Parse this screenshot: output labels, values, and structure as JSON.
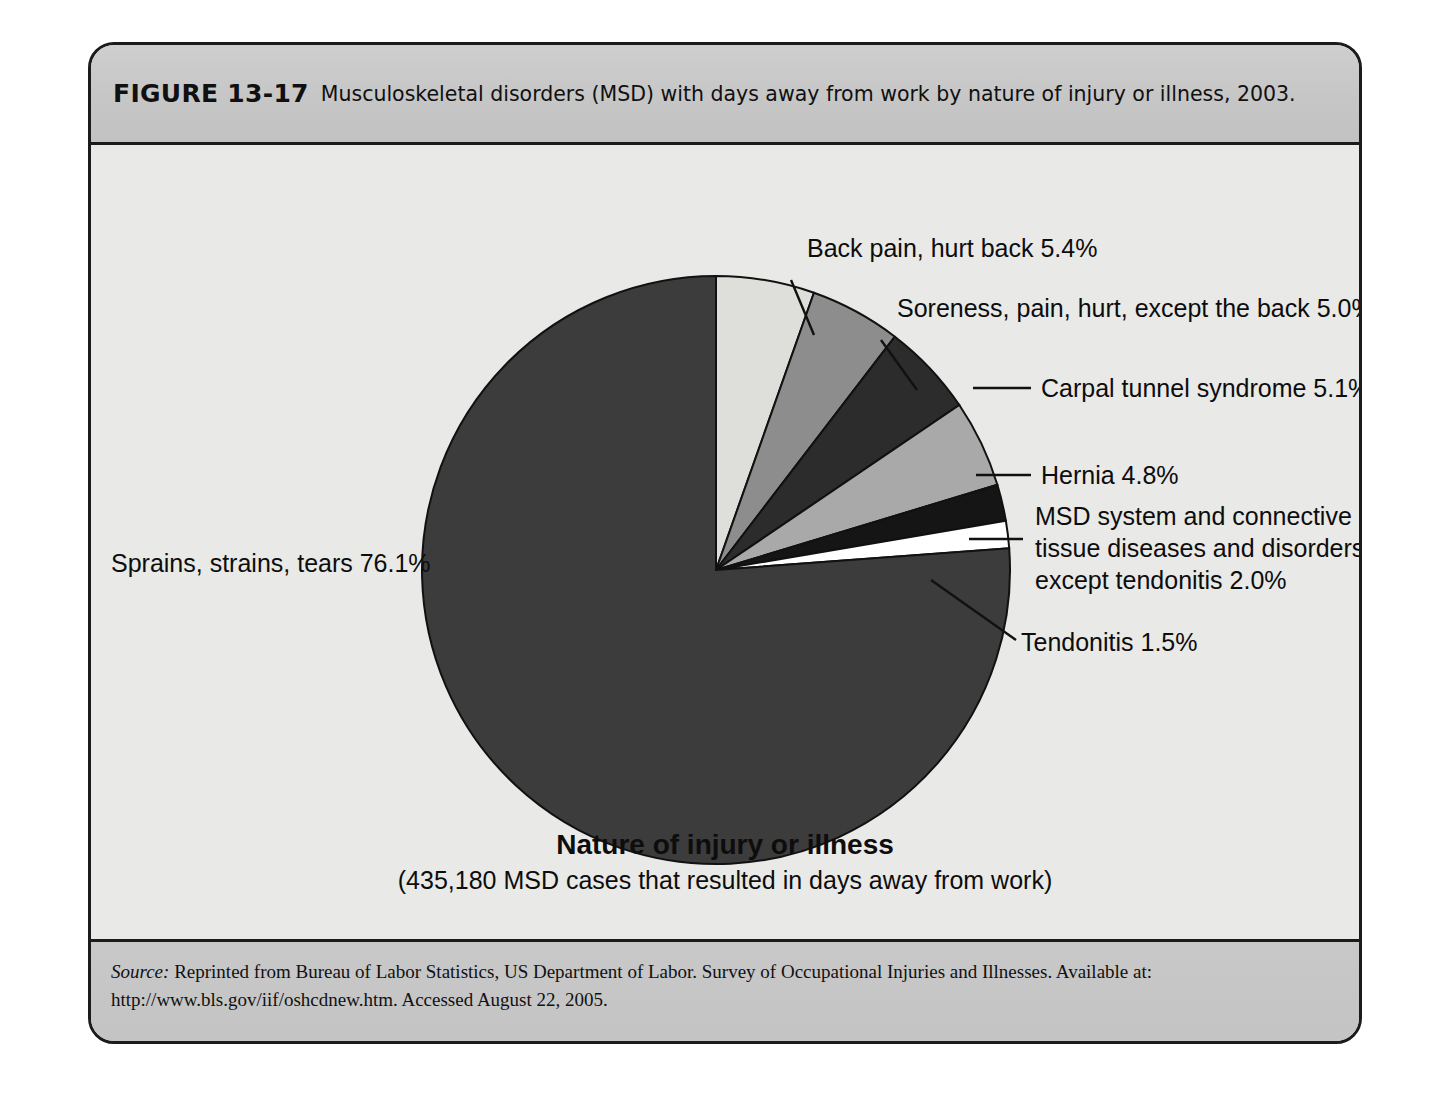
{
  "figure": {
    "number": "FIGURE 13-17",
    "caption": "Musculoskeletal disorders (MSD) with days away from work by nature of injury or illness, 2003."
  },
  "axis": {
    "title": "Nature of injury or illness",
    "subtitle": "(435,180 MSD cases that resulted in days away from work)"
  },
  "source": {
    "label": "Source:",
    "text": " Reprinted from Bureau of Labor Statistics, US Department of Labor. Survey of Occupational Injuries and Illnesses. Available at: http://www.bls.gov/iif/oshcdnew.htm. Accessed August 22, 2005."
  },
  "labels": {
    "sprains": "Sprains, strains, tears 76.1%",
    "back_pain": "Back pain, hurt back 5.4%",
    "soreness": "Soreness, pain, hurt, except the back 5.0%",
    "carpal": "Carpal tunnel syndrome 5.1%",
    "hernia": "Hernia 4.8%",
    "msd_line1": "MSD system and connective",
    "msd_line2": "tissue diseases and disorders,",
    "msd_line3": "except tendonitis 2.0%",
    "tendonitis": "Tendonitis 1.5%"
  },
  "chart_data": {
    "type": "pie",
    "title": "Musculoskeletal disorders (MSD) with days away from work by nature of injury or illness, 2003.",
    "xlabel": "Nature of injury or illness",
    "ylabel": "",
    "annotation": "(435,180 MSD cases that resulted in days away from work)",
    "total_cases": 435180,
    "units": "percent",
    "legend_position": "callout-labels",
    "grid": false,
    "start_angle_deg": 0,
    "direction": "clockwise",
    "categories": [
      "Back pain, hurt back",
      "Soreness, pain, hurt, except the back",
      "Carpal tunnel syndrome",
      "Hernia",
      "MSD system and connective tissue diseases and disorders, except tendonitis",
      "Tendonitis",
      "Sprains, strains, tears"
    ],
    "values": [
      5.4,
      5.0,
      5.1,
      4.8,
      2.0,
      1.5,
      76.1
    ],
    "colors": [
      "#dededa",
      "#8d8d8d",
      "#2c2c2c",
      "#a9a9a9",
      "#151515",
      "#ffffff",
      "#3c3c3c"
    ],
    "slices": [
      {
        "label": "Back pain, hurt back",
        "value": 5.4,
        "color": "#dededa"
      },
      {
        "label": "Soreness, pain, hurt, except the back",
        "value": 5.0,
        "color": "#8d8d8d"
      },
      {
        "label": "Carpal tunnel syndrome",
        "value": 5.1,
        "color": "#2c2c2c"
      },
      {
        "label": "Hernia",
        "value": 4.8,
        "color": "#a9a9a9"
      },
      {
        "label": "MSD system and connective tissue diseases and disorders, except tendonitis",
        "value": 2.0,
        "color": "#151515"
      },
      {
        "label": "Tendonitis",
        "value": 1.5,
        "color": "#ffffff"
      },
      {
        "label": "Sprains, strains, tears",
        "value": 76.1,
        "color": "#3c3c3c"
      }
    ]
  }
}
